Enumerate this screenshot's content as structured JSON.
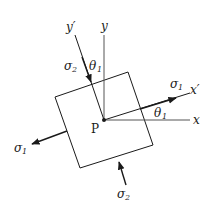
{
  "diagram": {
    "type": "stress-element",
    "labels": {
      "point": "P",
      "x_axis": "x",
      "y_axis": "y",
      "x_prime": "x′",
      "y_prime": "y′",
      "sigma1": "σ",
      "sigma1_sub": "1",
      "sigma2": "σ",
      "sigma2_sub": "2",
      "theta": "θ",
      "theta_sub": "1"
    },
    "colors": {
      "line": "#1a1a1a",
      "axis": "#555555",
      "background": "#ffffff"
    }
  }
}
